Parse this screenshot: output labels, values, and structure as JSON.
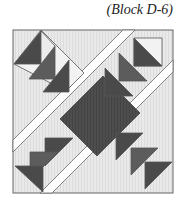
{
  "caption": "(Block D-6)",
  "colors": {
    "background": "#e6e6e6",
    "dark": "#4a4a4a",
    "medium": "#5c5c5c",
    "light": "#f2f2f2",
    "sashing": "#ffffff",
    "outline": "#555555"
  },
  "block": {
    "name": "quilt block diagram",
    "components": [
      "center-square",
      "goose-units-top-left",
      "goose-units-top-right",
      "goose-units-bottom-left",
      "goose-units-bottom-right",
      "diagonal-sashing-strips",
      "corner-triangles"
    ]
  }
}
